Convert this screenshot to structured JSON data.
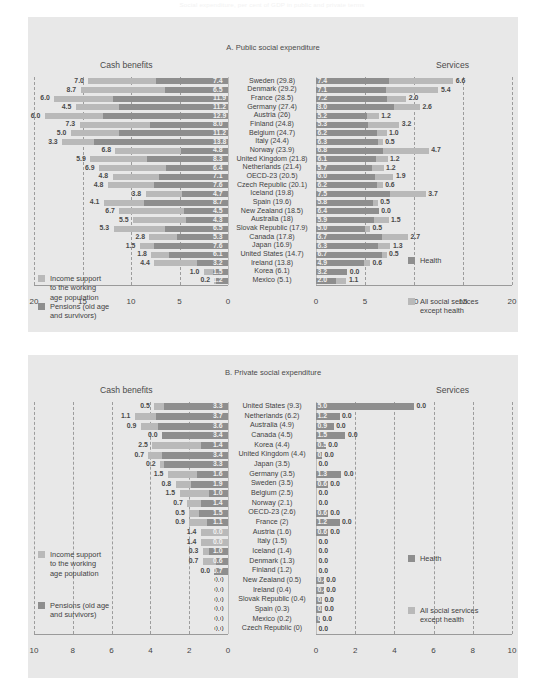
{
  "figure": {
    "caption": "Social expenditure, per cent of GDP in public and private terms"
  },
  "panels": [
    {
      "id": "A",
      "title": "A. Public social expenditure",
      "left_header": "Cash benefits",
      "right_header": "Services",
      "axis_left_ticks": [
        20,
        15,
        10,
        5,
        0
      ],
      "axis_right_ticks": [
        0,
        5,
        10,
        15,
        20
      ],
      "axis_max": 20,
      "legend_left": [
        {
          "swatch": "light",
          "label": "Income support\nto the working\nage population"
        },
        {
          "swatch": "dark",
          "label": "Pensions (old age\nand survivors)"
        }
      ],
      "legend_right": [
        {
          "swatch": "dark",
          "label": "Health"
        },
        {
          "swatch": "light",
          "label": "All social services\nexcept health"
        }
      ],
      "rows": [
        {
          "name": "Sweden (29.8)",
          "income": 7.0,
          "pensions": 7.4,
          "health": 7.4,
          "services": 6.6
        },
        {
          "name": "Denmark (29.2)",
          "income": 8.7,
          "pensions": 6.5,
          "health": 7.1,
          "services": 5.4
        },
        {
          "name": "France (28.5)",
          "income": 6.0,
          "pensions": 11.9,
          "health": 7.2,
          "services": 2.0
        },
        {
          "name": "Germany (27.4)",
          "income": 4.5,
          "pensions": 11.2,
          "health": 8.0,
          "services": 2.6
        },
        {
          "name": "Austria (26)",
          "income": 6.0,
          "pensions": 12.9,
          "health": 5.2,
          "services": 1.2
        },
        {
          "name": "Finland (24.8)",
          "income": 7.3,
          "pensions": 8.0,
          "health": 5.3,
          "services": 3.2
        },
        {
          "name": "Belgium (24.7)",
          "income": 5.0,
          "pensions": 11.2,
          "health": 6.2,
          "services": 1.0
        },
        {
          "name": "Italy (24.4)",
          "income": 3.3,
          "pensions": 13.8,
          "health": 6.3,
          "services": 0.5
        },
        {
          "name": "Norway (23.9)",
          "income": 6.8,
          "pensions": 4.8,
          "health": 6.8,
          "services": 4.7
        },
        {
          "name": "United Kingdom (21.8)",
          "income": 5.9,
          "pensions": 8.3,
          "health": 6.1,
          "services": 1.2
        },
        {
          "name": "Netherlands (21.4)",
          "income": 6.9,
          "pensions": 6.4,
          "health": 5.7,
          "services": 1.2
        },
        {
          "name": "OECD-23 (20.5)",
          "income": 4.8,
          "pensions": 7.1,
          "health": 6.0,
          "services": 1.9
        },
        {
          "name": "Czech Republic (20.1)",
          "income": 4.8,
          "pensions": 7.6,
          "health": 6.2,
          "services": 0.6
        },
        {
          "name": "Iceland (19.8)",
          "income": 3.8,
          "pensions": 4.7,
          "health": 7.5,
          "services": 3.7
        },
        {
          "name": "Spain (19.6)",
          "income": 4.1,
          "pensions": 8.7,
          "health": 5.8,
          "services": 0.5
        },
        {
          "name": "New Zealand (18.5)",
          "income": 6.7,
          "pensions": 4.5,
          "health": 6.4,
          "services": 0.0
        },
        {
          "name": "Australia (18)",
          "income": 5.5,
          "pensions": 4.3,
          "health": 5.9,
          "services": 1.5
        },
        {
          "name": "Slovak Republic (17.9)",
          "income": 5.3,
          "pensions": 6.5,
          "health": 5.0,
          "services": 0.5
        },
        {
          "name": "Canada (17.8)",
          "income": 2.8,
          "pensions": 5.3,
          "health": 6.7,
          "services": 2.7
        },
        {
          "name": "Japan (16.9)",
          "income": 1.5,
          "pensions": 7.6,
          "health": 6.3,
          "services": 1.3
        },
        {
          "name": "United States (14.7)",
          "income": 1.8,
          "pensions": 6.1,
          "health": 6.7,
          "services": 0.5
        },
        {
          "name": "Ireland (13.8)",
          "income": 4.4,
          "pensions": 3.2,
          "health": 4.9,
          "services": 0.6
        },
        {
          "name": "Korea (6.1)",
          "income": 1.0,
          "pensions": 1.5,
          "health": 3.2,
          "services": 0.0
        },
        {
          "name": "Mexico (5.1)",
          "income": 0.2,
          "pensions": 1.2,
          "health": 2.0,
          "services": 1.1
        }
      ]
    },
    {
      "id": "B",
      "title": "B. Private social expenditure",
      "left_header": "Cash benefits",
      "right_header": "Services",
      "axis_left_ticks": [
        10,
        8,
        6,
        4,
        2,
        0
      ],
      "axis_right_ticks": [
        0,
        2,
        4,
        6,
        8,
        10
      ],
      "axis_max": 10,
      "legend_left": [
        {
          "swatch": "light",
          "label": "Income support\nto the working\nage population"
        },
        {
          "swatch": "dark",
          "label": "Pensions (old age\nand survivors)"
        }
      ],
      "legend_right": [
        {
          "swatch": "dark",
          "label": "Health"
        },
        {
          "swatch": "light",
          "label": "All social services\nexcept health"
        }
      ],
      "rows": [
        {
          "name": "United States (9.3)",
          "income": 0.5,
          "pensions": 3.3,
          "health": 5.0,
          "services": 0.0
        },
        {
          "name": "Netherlands (6.2)",
          "income": 1.1,
          "pensions": 3.7,
          "health": 1.2,
          "services": 0.0
        },
        {
          "name": "Australia (4.9)",
          "income": 0.9,
          "pensions": 3.6,
          "health": 0.9,
          "services": 0.0
        },
        {
          "name": "Canada (4.5)",
          "income": 0.0,
          "pensions": 3.4,
          "health": 1.5,
          "services": 0.0
        },
        {
          "name": "Korea (4.4)",
          "income": 2.5,
          "pensions": 1.4,
          "health": 0.5,
          "services": 0.0
        },
        {
          "name": "United Kingdom (4.4)",
          "income": 0.7,
          "pensions": 3.4,
          "health": 0.3,
          "services": 0.0
        },
        {
          "name": "Japan (3.5)",
          "income": 0.2,
          "pensions": 3.3,
          "health": 0.0,
          "services": 0.0
        },
        {
          "name": "Germany (3.5)",
          "income": 1.5,
          "pensions": 1.6,
          "health": 1.3,
          "services": 0.0
        },
        {
          "name": "Sweden (3.5)",
          "income": 0.8,
          "pensions": 1.9,
          "health": 0.6,
          "services": 0.0
        },
        {
          "name": "Belgium (2.5)",
          "income": 1.5,
          "pensions": 1.0,
          "health": 0.0,
          "services": 0.0
        },
        {
          "name": "Norway (2.1)",
          "income": 0.7,
          "pensions": 1.4,
          "health": 0.0,
          "services": 0.0
        },
        {
          "name": "OECD-23 (2.6)",
          "income": 0.5,
          "pensions": 1.5,
          "health": 0.6,
          "services": 0.0
        },
        {
          "name": "France (2)",
          "income": 0.9,
          "pensions": 1.1,
          "health": 1.2,
          "services": 0.0
        },
        {
          "name": "Austria (1.6)",
          "income": 1.4,
          "pensions": 0.0,
          "health": 0.6,
          "services": 0.0
        },
        {
          "name": "Italy (1.5)",
          "income": 1.4,
          "pensions": 0.0,
          "health": 0.0,
          "services": 0.0
        },
        {
          "name": "Iceland (1.4)",
          "income": 0.3,
          "pensions": 1.0,
          "health": 0.0,
          "services": 0.0
        },
        {
          "name": "Denmark (1.3)",
          "income": 0.7,
          "pensions": 0.6,
          "health": 0.0,
          "services": 0.0
        },
        {
          "name": "Finland (1.2)",
          "income": 0.0,
          "pensions": 0.7,
          "health": 0.0,
          "services": 0.0
        },
        {
          "name": "New Zealand (0.5)",
          "income": 0.0,
          "pensions": 0.0,
          "health": 0.4,
          "services": 0.0
        },
        {
          "name": "Ireland (0.4)",
          "income": 0.0,
          "pensions": 0.0,
          "health": 0.4,
          "services": 0.0
        },
        {
          "name": "Slovak Republic (0.4)",
          "income": 0.0,
          "pensions": 0.0,
          "health": 0.3,
          "services": 0.0
        },
        {
          "name": "Spain (0.3)",
          "income": 0.0,
          "pensions": 0.0,
          "health": 0.3,
          "services": 0.0
        },
        {
          "name": "Mexico (0.2)",
          "income": 0.0,
          "pensions": 0.0,
          "health": 0.2,
          "services": 0.0
        },
        {
          "name": "Czech Republic (0)",
          "income": 0.0,
          "pensions": 0.0,
          "health": 0.0,
          "services": 0.0
        }
      ]
    }
  ],
  "chart_data": {
    "type": "bar",
    "title": "Social expenditure, per cent of GDP in public and private terms",
    "orientation": "horizontal-diverging-pair",
    "grid": true,
    "panels": [
      {
        "title": "A. Public social expenditure",
        "xlabel_left": "Cash benefits",
        "xlabel_right": "Services",
        "xlim_left": [
          20,
          0
        ],
        "xlim_right": [
          0,
          20
        ],
        "categories": [
          "Sweden (29.8)",
          "Denmark (29.2)",
          "France (28.5)",
          "Germany (27.4)",
          "Austria (26)",
          "Finland (24.8)",
          "Belgium (24.7)",
          "Italy (24.4)",
          "Norway (23.9)",
          "United Kingdom (21.8)",
          "Netherlands (21.4)",
          "OECD-23 (20.5)",
          "Czech Republic (20.1)",
          "Iceland (19.8)",
          "Spain (19.6)",
          "New Zealand (18.5)",
          "Australia (18)",
          "Slovak Republic (17.9)",
          "Canada (17.8)",
          "Japan (16.9)",
          "United States (14.7)",
          "Ireland (13.8)",
          "Korea (6.1)",
          "Mexico (5.1)"
        ],
        "series": [
          {
            "name": "Income support to the working age population",
            "side": "left",
            "color": "#b9b9b9",
            "values": [
              7.0,
              8.7,
              6.0,
              4.5,
              6.0,
              7.3,
              5.0,
              3.3,
              6.8,
              5.9,
              6.9,
              4.8,
              4.8,
              3.8,
              4.1,
              6.7,
              5.5,
              5.3,
              2.8,
              1.5,
              1.8,
              4.4,
              1.0,
              0.2
            ]
          },
          {
            "name": "Pensions (old age and survivors)",
            "side": "left",
            "color": "#8e8e8e",
            "values": [
              7.4,
              6.5,
              11.9,
              11.2,
              12.9,
              8.0,
              11.2,
              13.8,
              4.8,
              8.3,
              6.4,
              7.1,
              7.6,
              4.7,
              8.7,
              4.5,
              4.3,
              6.5,
              5.3,
              7.6,
              6.1,
              3.2,
              1.5,
              1.2
            ]
          },
          {
            "name": "Health",
            "side": "right",
            "color": "#8e8e8e",
            "values": [
              7.4,
              7.1,
              7.2,
              8.0,
              5.2,
              5.3,
              6.2,
              6.3,
              6.8,
              6.1,
              5.7,
              6.0,
              6.2,
              7.5,
              5.8,
              6.4,
              5.9,
              5.0,
              6.7,
              6.3,
              6.7,
              4.9,
              3.2,
              2.0
            ]
          },
          {
            "name": "All social services except health",
            "side": "right",
            "color": "#b9b9b9",
            "values": [
              6.6,
              5.4,
              2.0,
              2.6,
              1.2,
              3.2,
              1.0,
              0.5,
              4.7,
              1.2,
              1.2,
              1.9,
              0.6,
              3.7,
              0.5,
              0.0,
              1.5,
              0.5,
              2.7,
              1.3,
              0.5,
              0.6,
              0.0,
              1.1
            ]
          }
        ]
      },
      {
        "title": "B. Private social expenditure",
        "xlabel_left": "Cash benefits",
        "xlabel_right": "Services",
        "xlim_left": [
          10,
          0
        ],
        "xlim_right": [
          0,
          10
        ],
        "categories": [
          "United States (9.3)",
          "Netherlands (6.2)",
          "Australia (4.9)",
          "Canada (4.5)",
          "Korea (4.4)",
          "United Kingdom (4.4)",
          "Japan (3.5)",
          "Germany (3.5)",
          "Sweden (3.5)",
          "Belgium (2.5)",
          "Norway (2.1)",
          "OECD-23 (2.6)",
          "France (2)",
          "Austria (1.6)",
          "Italy (1.5)",
          "Iceland (1.4)",
          "Denmark (1.3)",
          "Finland (1.2)",
          "New Zealand (0.5)",
          "Ireland (0.4)",
          "Slovak Republic (0.4)",
          "Spain (0.3)",
          "Mexico (0.2)",
          "Czech Republic (0)"
        ],
        "series": [
          {
            "name": "Income support to the working age population",
            "side": "left",
            "color": "#b9b9b9",
            "values": [
              0.5,
              1.1,
              0.9,
              0.0,
              2.5,
              0.7,
              0.2,
              1.5,
              0.8,
              1.5,
              0.7,
              0.5,
              0.9,
              1.4,
              1.4,
              0.3,
              0.7,
              0.0,
              0.0,
              0.0,
              0.0,
              0.0,
              0.0,
              0.0
            ]
          },
          {
            "name": "Pensions (old age and survivors)",
            "side": "left",
            "color": "#8e8e8e",
            "values": [
              3.3,
              3.7,
              3.6,
              3.4,
              1.4,
              3.4,
              3.3,
              1.6,
              1.9,
              1.0,
              1.4,
              1.5,
              1.1,
              0.0,
              0.0,
              1.0,
              0.6,
              0.7,
              0.0,
              0.0,
              0.0,
              0.0,
              0.0,
              0.0
            ]
          },
          {
            "name": "Health",
            "side": "right",
            "color": "#8e8e8e",
            "values": [
              5.0,
              1.2,
              0.9,
              1.5,
              0.5,
              0.3,
              0.0,
              1.3,
              0.6,
              0.0,
              0.0,
              0.6,
              1.2,
              0.6,
              0.0,
              0.0,
              0.0,
              0.0,
              0.4,
              0.4,
              0.3,
              0.3,
              0.2,
              0.0
            ]
          },
          {
            "name": "All social services except health",
            "side": "right",
            "color": "#b9b9b9",
            "values": [
              0.0,
              0.0,
              0.0,
              0.0,
              0.0,
              0.0,
              0.0,
              0.0,
              0.0,
              0.0,
              0.0,
              0.0,
              0.0,
              0.0,
              0.0,
              0.0,
              0.0,
              0.0,
              0.0,
              0.0,
              0.0,
              0.0,
              0.0,
              0.0
            ]
          }
        ]
      }
    ]
  }
}
